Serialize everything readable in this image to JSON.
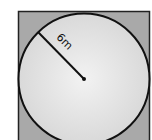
{
  "diagram": {
    "radius_label": "6m",
    "colors": {
      "square_fill": "#a8a8a8",
      "circle_fill": "#e4e4e4",
      "stroke": "#111111"
    }
  }
}
